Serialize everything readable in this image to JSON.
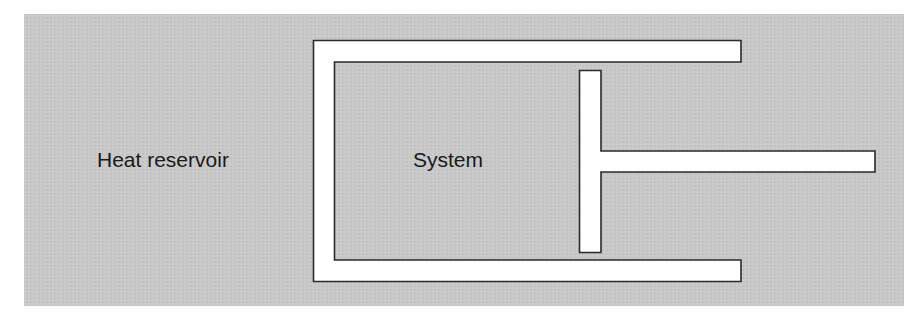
{
  "diagram": {
    "type": "piston-cylinder",
    "labels": {
      "reservoir": "Heat reservoir",
      "system": "System"
    },
    "colors": {
      "background": "#c9c9c9",
      "walls": "#ffffff",
      "outline": "#2a2a2a",
      "text": "#1a1a1a"
    },
    "components": [
      {
        "name": "heat-reservoir",
        "label": "Heat reservoir"
      },
      {
        "name": "cylinder",
        "label": ""
      },
      {
        "name": "system",
        "label": "System"
      },
      {
        "name": "piston-head",
        "label": ""
      },
      {
        "name": "piston-rod",
        "label": ""
      }
    ]
  }
}
